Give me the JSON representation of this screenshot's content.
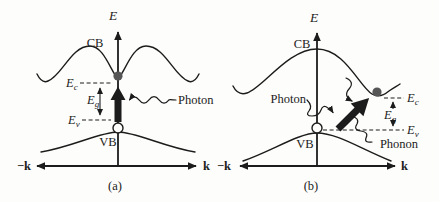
{
  "colors": {
    "background": "#fdfdfb",
    "ink": "#1c1c1c",
    "electron": "#565656"
  },
  "panel_a": {
    "caption": "(a)",
    "axis": {
      "energy": "E",
      "k_negative": "−k",
      "k_positive": "k"
    },
    "bands": {
      "conduction": "CB",
      "valence": "VB"
    },
    "levels": {
      "ec_symbol": "E",
      "ec_sub": "c",
      "eg_symbol": "E",
      "eg_sub": "g",
      "ev_symbol": "E",
      "ev_sub": "v"
    },
    "annotations": {
      "photon": "Photon"
    }
  },
  "panel_b": {
    "caption": "(b)",
    "axis": {
      "energy": "E",
      "k_negative": "−k",
      "k_positive": "k"
    },
    "bands": {
      "conduction": "CB",
      "valence": "VB"
    },
    "levels": {
      "ec_symbol": "E",
      "ec_sub": "c",
      "eg_symbol": "E",
      "eg_sub": "g",
      "ev_symbol": "E",
      "ev_sub": "v"
    },
    "annotations": {
      "photon": "Photon",
      "phonon": "Phonon"
    }
  }
}
